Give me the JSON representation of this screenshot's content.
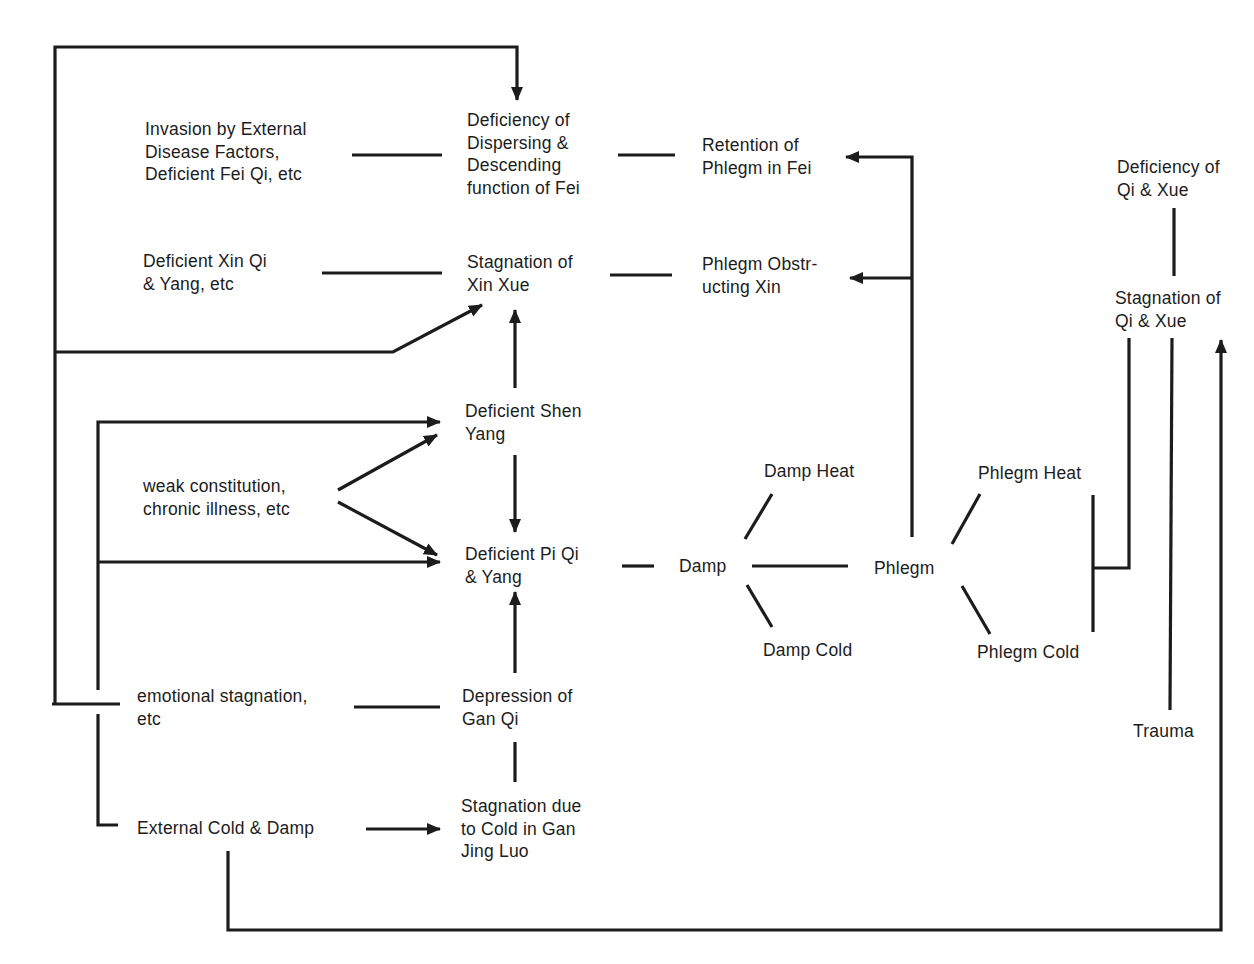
{
  "diagram": {
    "type": "flow-diagram",
    "ink_color": "#1c1c1c",
    "background": "#ffffff",
    "nodes": {
      "invasion": "Invasion by External\nDisease Factors,\nDeficient Fei Qi, etc",
      "deficiency_fei": "Deficiency of\nDispersing &\nDescending\nfunction of Fei",
      "retention_phlegm": "Retention of\nPhlegm in Fei",
      "deficiency_qi_xue": "Deficiency of\nQi & Xue",
      "deficient_xin_qi": "Deficient Xin Qi\n& Yang, etc",
      "stagnation_xin_xue": "Stagnation of\nXin Xue",
      "phlegm_obstructing": "Phlegm Obstr-\nucting Xin",
      "stagnation_qi_xue": "Stagnation of\nQi & Xue",
      "deficient_shen_yang": "Deficient Shen\nYang",
      "weak_constitution": "weak constitution,\nchronic illness, etc",
      "damp_heat": "Damp Heat",
      "phlegm_heat": "Phlegm Heat",
      "deficient_pi": "Deficient Pi Qi\n& Yang",
      "damp": "Damp",
      "phlegm": "Phlegm",
      "damp_cold": "Damp Cold",
      "phlegm_cold": "Phlegm Cold",
      "emotional": "emotional stagnation,\netc",
      "depression_gan": "Depression of\nGan Qi",
      "trauma": "Trauma",
      "external_cold": "External Cold & Damp",
      "stagnation_cold_gan": "Stagnation due\nto Cold in Gan\nJing Luo"
    },
    "edges": [
      {
        "from": "emotional",
        "to": "deficiency_fei",
        "type": "arrow"
      },
      {
        "from": "invasion",
        "to": "deficiency_fei",
        "type": "line"
      },
      {
        "from": "deficiency_fei",
        "to": "retention_phlegm",
        "type": "line"
      },
      {
        "from": "phlegm",
        "to": "retention_phlegm",
        "type": "arrow"
      },
      {
        "from": "phlegm",
        "to": "phlegm_obstructing",
        "type": "arrow"
      },
      {
        "from": "deficient_xin_qi",
        "to": "stagnation_xin_xue",
        "type": "line"
      },
      {
        "from": "stagnation_xin_xue",
        "to": "phlegm_obstructing",
        "type": "line"
      },
      {
        "from": "emotional",
        "to": "stagnation_xin_xue",
        "type": "arrow"
      },
      {
        "from": "deficient_shen_yang",
        "to": "stagnation_xin_xue",
        "type": "arrow"
      },
      {
        "from": "emotional",
        "to": "deficient_shen_yang",
        "type": "arrow"
      },
      {
        "from": "emotional",
        "to": "deficient_pi",
        "type": "arrow"
      },
      {
        "from": "weak_constitution",
        "to": "deficient_shen_yang",
        "type": "arrow"
      },
      {
        "from": "weak_constitution",
        "to": "deficient_pi",
        "type": "arrow"
      },
      {
        "from": "deficient_shen_yang",
        "to": "deficient_pi",
        "type": "arrow"
      },
      {
        "from": "depression_gan",
        "to": "deficient_pi",
        "type": "arrow"
      },
      {
        "from": "deficient_pi",
        "to": "damp",
        "type": "line"
      },
      {
        "from": "damp",
        "to": "damp_heat",
        "type": "line"
      },
      {
        "from": "damp",
        "to": "damp_cold",
        "type": "line"
      },
      {
        "from": "damp",
        "to": "phlegm",
        "type": "line"
      },
      {
        "from": "phlegm",
        "to": "phlegm_heat",
        "type": "line"
      },
      {
        "from": "phlegm",
        "to": "phlegm_cold",
        "type": "line"
      },
      {
        "from": "phlegm_heat",
        "to": "stagnation_qi_xue",
        "type": "line"
      },
      {
        "from": "phlegm_cold",
        "to": "stagnation_qi_xue",
        "type": "line"
      },
      {
        "from": "deficiency_qi_xue",
        "to": "stagnation_qi_xue",
        "type": "line"
      },
      {
        "from": "trauma",
        "to": "stagnation_qi_xue",
        "type": "line"
      },
      {
        "from": "external_cold",
        "to": "stagnation_qi_xue",
        "type": "arrow"
      },
      {
        "from": "emotional",
        "to": "depression_gan",
        "type": "line"
      },
      {
        "from": "depression_gan",
        "to": "stagnation_cold_gan",
        "type": "line"
      },
      {
        "from": "emotional",
        "to": "external_cold",
        "type": "line"
      },
      {
        "from": "external_cold",
        "to": "stagnation_cold_gan",
        "type": "arrow"
      }
    ]
  }
}
